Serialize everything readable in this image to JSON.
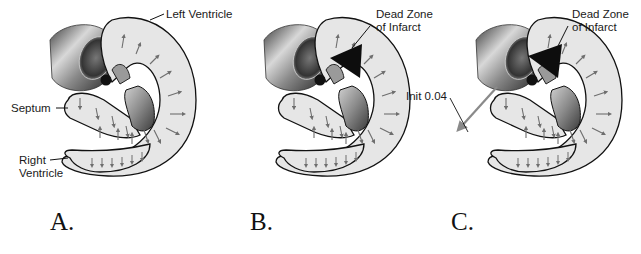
{
  "figure": {
    "panels": [
      {
        "id": "A",
        "letter": "A.",
        "labels": {
          "left_ventricle": "Left Ventricle",
          "septum": "Septum",
          "right_ventricle_1": "Right",
          "right_ventricle_2": "Ventricle"
        }
      },
      {
        "id": "B",
        "letter": "B.",
        "labels": {
          "dead_zone_1": "Dead Zone",
          "dead_zone_2": "of Infarct"
        }
      },
      {
        "id": "C",
        "letter": "C.",
        "labels": {
          "dead_zone_1": "Dead Zone",
          "dead_zone_2": "of Infarct",
          "init_vector": "Init 0.04"
        }
      }
    ],
    "colors": {
      "wall_fill": "#e6e6e6",
      "outline": "#111111",
      "arrow": "#6e6e6e",
      "infarct": "#0d0d0d",
      "electrode": "#111111"
    }
  }
}
